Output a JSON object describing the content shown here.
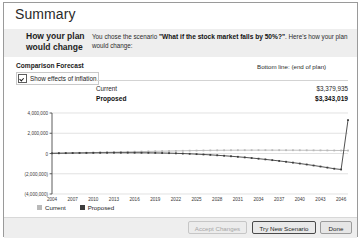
{
  "window": {
    "title": "Summary"
  },
  "intro": {
    "heading": "How your plan would change",
    "text_before": "You chose the scenario ",
    "scenario": "\"What if the stock market falls by 50%?\"",
    "text_after": ". Here's how your plan would change:"
  },
  "forecast": {
    "section_label": "Comparison Forecast",
    "inflation_checkbox_label": "Show effects of inflation",
    "inflation_checked": true,
    "bottom_line_label": "Bottom line: (end of plan)",
    "rows": [
      {
        "name": "Current",
        "value": "$3,379,935"
      },
      {
        "name": "Proposed",
        "value": "$3,343,019"
      }
    ]
  },
  "legend": {
    "items": [
      {
        "label": "Current",
        "color": "#b9b9b9"
      },
      {
        "label": "Proposed",
        "color": "#3d3d3d"
      }
    ]
  },
  "buttons": {
    "accept": "Accept Changes",
    "try_new": "Try New Scenario",
    "done": "Done"
  },
  "chart_data": {
    "type": "line",
    "title": "",
    "xlabel": "",
    "ylabel": "",
    "ylim": [
      -4000000,
      4000000
    ],
    "ytick_labels": [
      "4,000,000",
      "2,000,000",
      "0",
      "(2,000,000)",
      "(4,000,000)"
    ],
    "ytick_values": [
      4000000,
      2000000,
      0,
      -2000000,
      -4000000
    ],
    "xtick_labels": [
      "2004",
      "2007",
      "2010",
      "2013",
      "2016",
      "2019",
      "2022",
      "2025",
      "2028",
      "2031",
      "2034",
      "2037",
      "2040",
      "2043",
      "2046"
    ],
    "xtick_values": [
      2004,
      2007,
      2010,
      2013,
      2016,
      2019,
      2022,
      2025,
      2028,
      2031,
      2034,
      2037,
      2040,
      2043,
      2046
    ],
    "x": [
      2004,
      2005,
      2006,
      2007,
      2008,
      2009,
      2010,
      2011,
      2012,
      2013,
      2014,
      2015,
      2016,
      2017,
      2018,
      2019,
      2020,
      2021,
      2022,
      2023,
      2024,
      2025,
      2026,
      2027,
      2028,
      2029,
      2030,
      2031,
      2032,
      2033,
      2034,
      2035,
      2036,
      2037,
      2038,
      2039,
      2040,
      2041,
      2042,
      2043,
      2044,
      2045,
      2046,
      2047
    ],
    "grid": true,
    "legend_position": "bottom-left",
    "series": [
      {
        "name": "Current",
        "color": "#b9b9b9",
        "values": [
          20000,
          30000,
          42000,
          55000,
          68000,
          80000,
          95000,
          110000,
          125000,
          140000,
          152000,
          165000,
          178000,
          190000,
          205000,
          218000,
          232000,
          245000,
          258000,
          270000,
          282000,
          292000,
          300000,
          308000,
          315000,
          320000,
          324000,
          327000,
          329000,
          330000,
          331000,
          331000,
          330000,
          329000,
          327000,
          325000,
          322000,
          318000,
          314000,
          310000,
          305000,
          300000,
          296000,
          292000
        ]
      },
      {
        "name": "Proposed",
        "color": "#3d3d3d",
        "values": [
          20000,
          28000,
          36000,
          45000,
          52000,
          58000,
          64000,
          70000,
          74000,
          78000,
          80000,
          80000,
          78000,
          74000,
          68000,
          60000,
          48000,
          34000,
          16000,
          -6000,
          -32000,
          -62000,
          -96000,
          -134000,
          -176000,
          -222000,
          -272000,
          -326000,
          -384000,
          -446000,
          -512000,
          -582000,
          -656000,
          -734000,
          -816000,
          -902000,
          -992000,
          -1086000,
          -1184000,
          -1286000,
          -1392000,
          -1502000,
          -1580000,
          3300000
        ]
      }
    ]
  }
}
